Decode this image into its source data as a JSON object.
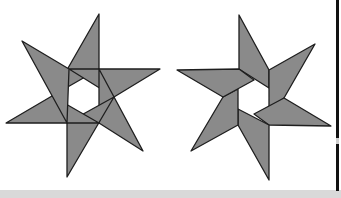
{
  "figure": {
    "stars": [
      {
        "name": "left-star",
        "points": 6,
        "style": "overlapping triangles forming inner hexagon"
      },
      {
        "name": "right-star",
        "points": 6,
        "style": "folded quadrilateral arms forming inner hexagon"
      }
    ],
    "colors": {
      "fill": "#8a8a8a",
      "stroke": "#1e1e1e",
      "background": "#ffffff",
      "bottom_strip": "#d9d9d9",
      "edge_bar": "#111111"
    }
  }
}
